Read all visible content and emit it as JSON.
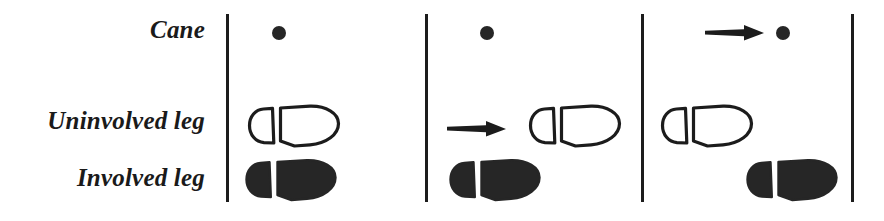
{
  "figure": {
    "width": 884,
    "height": 221,
    "background_color": "#ffffff",
    "ink_color": "#1c1c1c"
  },
  "row_labels": {
    "cane": "Cane",
    "uninvolved_leg": "Uninvolved leg",
    "involved_leg": "Involved leg"
  },
  "dividers": [
    {
      "name": "divider-1",
      "x": 226
    },
    {
      "name": "divider-2",
      "x": 425
    },
    {
      "name": "divider-3",
      "x": 641
    },
    {
      "name": "divider-4",
      "x": 851
    }
  ],
  "panels": [
    {
      "name": "panel-1",
      "order": 1,
      "cane": {
        "dot_x": 272,
        "dot_y": 26,
        "arrow": false
      },
      "uninvolved_leg": {
        "foot_x": 246,
        "foot_y": 103,
        "filled": false,
        "arrow": false
      },
      "involved_leg": {
        "foot_x": 243,
        "foot_y": 157,
        "filled": true,
        "arrow": false
      }
    },
    {
      "name": "panel-2",
      "order": 2,
      "cane": {
        "dot_x": 480,
        "dot_y": 26,
        "arrow": false
      },
      "uninvolved_leg": {
        "foot_x": 527,
        "foot_y": 103,
        "filled": false,
        "arrow": true,
        "arrow_x": 446,
        "arrow_y": 117
      },
      "involved_leg": {
        "foot_x": 447,
        "foot_y": 157,
        "filled": true,
        "arrow": false
      }
    },
    {
      "name": "panel-3",
      "order": 3,
      "cane": {
        "dot_x": 776,
        "dot_y": 26,
        "arrow": true,
        "arrow_x": 704,
        "arrow_y": 21
      },
      "uninvolved_leg": {
        "foot_x": 659,
        "foot_y": 103,
        "filled": false,
        "arrow": false
      },
      "involved_leg": {
        "foot_x": 744,
        "foot_y": 157,
        "filled": true,
        "arrow": false
      }
    }
  ],
  "legend": {
    "open_outline_meaning": "Uninvolved leg footprint (outline)",
    "filled_meaning": "Involved leg footprint (solid)",
    "dot_meaning": "Cane tip contact point",
    "arrow_meaning": "Element that advances in this step"
  }
}
